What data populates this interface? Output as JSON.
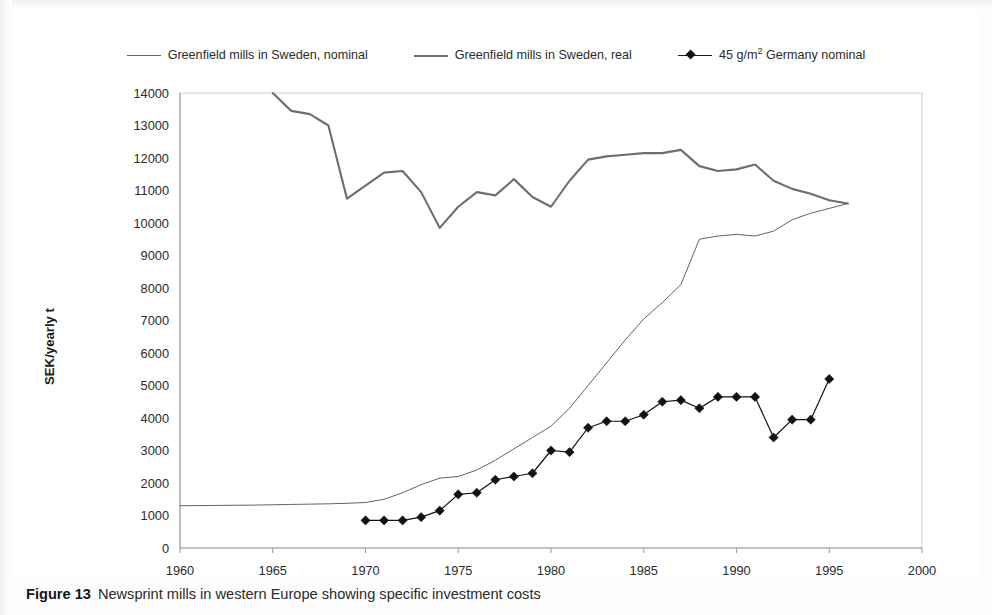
{
  "figure": {
    "caption_label": "Figure 13",
    "caption_text": "Newsprint mills in western Europe showing specific investment costs"
  },
  "legend": {
    "position": "top-center",
    "entries": [
      {
        "label": "Greenfield mills in Sweden, nominal",
        "style": "thin-line",
        "color": "#636363",
        "marker": "none"
      },
      {
        "label": "Greenfield mills in Sweden, real",
        "style": "thick-line",
        "color": "#6e6e6e",
        "marker": "none"
      },
      {
        "label_pre": "45 g/m",
        "label_sup": "2",
        "label_post": " Germany nominal",
        "style": "line-marker",
        "color": "#121212",
        "marker": "diamond"
      }
    ]
  },
  "chart_data": {
    "type": "line",
    "title": "",
    "subtitle": "",
    "xlabel": "",
    "ylabel": "SEK/yearly t",
    "xlim": [
      1960,
      2000
    ],
    "ylim": [
      0,
      14000
    ],
    "xticks": [
      1960,
      1965,
      1970,
      1975,
      1980,
      1985,
      1990,
      1995,
      2000
    ],
    "yticks": [
      0,
      1000,
      2000,
      3000,
      4000,
      5000,
      6000,
      7000,
      8000,
      9000,
      10000,
      11000,
      12000,
      13000,
      14000
    ],
    "grid": false,
    "series": [
      {
        "name": "Greenfield mills in Sweden, nominal",
        "color": "#636363",
        "width": 1.0,
        "marker": "none",
        "x": [
          1960,
          1961,
          1962,
          1963,
          1964,
          1965,
          1966,
          1967,
          1968,
          1969,
          1970,
          1971,
          1972,
          1973,
          1974,
          1975,
          1976,
          1977,
          1978,
          1979,
          1980,
          1981,
          1982,
          1983,
          1984,
          1985,
          1986,
          1987,
          1988,
          1989,
          1990,
          1991,
          1992,
          1993,
          1994,
          1995,
          1996
        ],
        "y": [
          1300,
          1305,
          1310,
          1315,
          1320,
          1330,
          1340,
          1350,
          1360,
          1375,
          1400,
          1500,
          1700,
          1950,
          2150,
          2200,
          2400,
          2700,
          3050,
          3400,
          3750,
          4300,
          5000,
          5700,
          6400,
          7050,
          7550,
          8100,
          9500,
          9600,
          9650,
          9600,
          9750,
          10100,
          10300,
          10450,
          10600
        ]
      },
      {
        "name": "Greenfield mills in Sweden, real",
        "color": "#6e6e6e",
        "width": 2.1,
        "marker": "none",
        "x": [
          1965,
          1966,
          1967,
          1968,
          1969,
          1970,
          1971,
          1972,
          1973,
          1974,
          1975,
          1976,
          1977,
          1978,
          1979,
          1980,
          1981,
          1982,
          1983,
          1984,
          1985,
          1986,
          1987,
          1988,
          1989,
          1990,
          1991,
          1992,
          1993,
          1994,
          1995,
          1996
        ],
        "y": [
          14000,
          13450,
          13350,
          13000,
          10750,
          11150,
          11550,
          11600,
          10950,
          9850,
          10500,
          10950,
          10850,
          11350,
          10800,
          10500,
          11300,
          11950,
          12050,
          12100,
          12150,
          12150,
          12250,
          11750,
          11600,
          11650,
          11800,
          11300,
          11050,
          10900,
          10700,
          10600
        ]
      },
      {
        "name": "45 g/m2 Germany nominal",
        "color": "#121212",
        "width": 1.2,
        "marker": "diamond",
        "x": [
          1970,
          1971,
          1972,
          1973,
          1974,
          1975,
          1976,
          1977,
          1978,
          1979,
          1980,
          1981,
          1982,
          1983,
          1984,
          1985,
          1986,
          1987,
          1988,
          1989,
          1990,
          1991,
          1992,
          1993,
          1994,
          1995
        ],
        "y": [
          850,
          850,
          850,
          950,
          1150,
          1650,
          1700,
          2100,
          2200,
          2300,
          3000,
          2950,
          3700,
          3900,
          3900,
          4100,
          4500,
          4550,
          4300,
          4650,
          4650,
          4650,
          3400,
          3950,
          3950,
          5200
        ]
      }
    ]
  }
}
